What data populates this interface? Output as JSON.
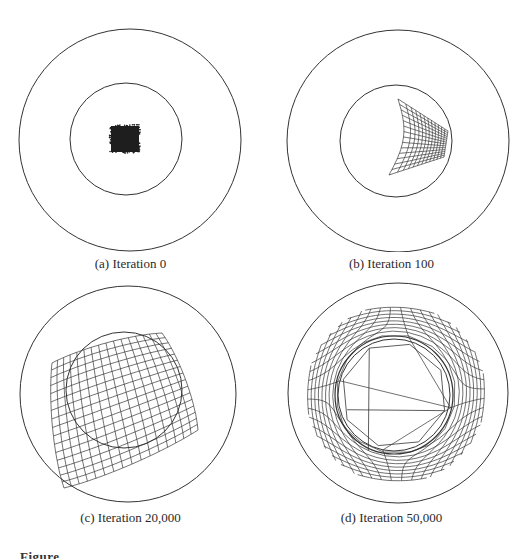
{
  "figure": {
    "label": "Figure",
    "stroke_color": "#333333",
    "background": "#ffffff"
  },
  "panels": [
    {
      "id": "a",
      "caption": "(a) Iteration 0",
      "outer_circle": {
        "cx": 130,
        "cy": 140,
        "r": 111
      },
      "inner_circle": {
        "cx": 126,
        "cy": 139,
        "r": 56
      },
      "mesh": {
        "type": "blob",
        "x": 111,
        "y": 126,
        "w": 28,
        "h": 26
      }
    },
    {
      "id": "b",
      "caption": "(b) Iteration 100",
      "outer_circle": {
        "cx": 137,
        "cy": 141,
        "r": 111
      },
      "inner_circle": {
        "cx": 135,
        "cy": 141,
        "r": 56
      },
      "mesh": {
        "type": "curved",
        "rows": 14,
        "cols": 12,
        "corners": {
          "tl": [
            137,
            99
          ],
          "tr": [
            187,
            131
          ],
          "br": [
            183,
            157
          ],
          "bl": [
            128,
            175
          ]
        }
      }
    },
    {
      "id": "c",
      "caption": "(c) Iteration 20,000",
      "outer_circle": {
        "cx": 128,
        "cy": 116,
        "r": 108
      },
      "inner_circle": {
        "cx": 124,
        "cy": 112,
        "r": 58
      },
      "mesh": {
        "type": "bulge",
        "rows": 16,
        "cols": 16,
        "corners": {
          "tl": [
            52,
            85
          ],
          "tr": [
            162,
            55
          ],
          "br": [
            198,
            152
          ],
          "bl": [
            64,
            210
          ]
        }
      }
    },
    {
      "id": "d",
      "caption": "(d) Iteration 50,000",
      "outer_circle": {
        "cx": 137,
        "cy": 115,
        "r": 110
      },
      "inner_circle": {
        "cx": 133,
        "cy": 117,
        "r": 56
      },
      "mesh": {
        "type": "ring",
        "rows": 18,
        "cols": 18,
        "outer_r": 98,
        "inner_r": 56,
        "center": [
          135,
          116
        ]
      }
    }
  ]
}
